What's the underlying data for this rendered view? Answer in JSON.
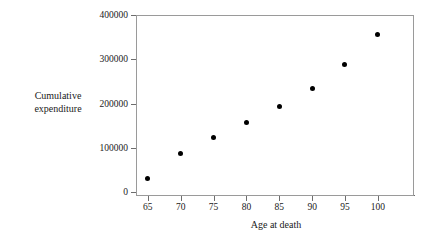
{
  "chart_data": {
    "type": "scatter",
    "title": "",
    "xlabel": "Age at death",
    "ylabel_line1": "Cumulative",
    "ylabel_line2": "expenditure",
    "ylabel": "Cumulative expenditure",
    "x": [
      65,
      70,
      75,
      80,
      85,
      90,
      95,
      100
    ],
    "values": [
      30000,
      87000,
      123000,
      157000,
      194000,
      235000,
      288000,
      357000
    ],
    "points": [
      {
        "x": 65,
        "y": 30000
      },
      {
        "x": 70,
        "y": 87000
      },
      {
        "x": 75,
        "y": 123000
      },
      {
        "x": 80,
        "y": 157000
      },
      {
        "x": 85,
        "y": 194000
      },
      {
        "x": 90,
        "y": 235000
      },
      {
        "x": 95,
        "y": 288000
      },
      {
        "x": 100,
        "y": 357000
      }
    ],
    "xlim": [
      63.2,
      105.5
    ],
    "ylim": [
      0,
      400000
    ],
    "xticks": [
      65,
      70,
      75,
      80,
      85,
      90,
      95,
      100
    ],
    "xtick_labels": [
      "65",
      "70",
      "75",
      "80",
      "85",
      "90",
      "95",
      "100"
    ],
    "yticks": [
      0,
      100000,
      200000,
      300000,
      400000
    ],
    "ytick_labels": [
      "0",
      "100000",
      "200000",
      "300000",
      "400000"
    ],
    "grid": false,
    "legend": null,
    "marker": "filled-circle",
    "marker_color": "#000000",
    "frame_color": "#6d6d6d"
  }
}
